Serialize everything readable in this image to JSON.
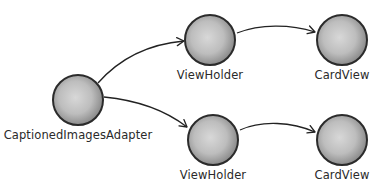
{
  "diagram": {
    "type": "object-relationship",
    "nodes": [
      {
        "id": "adapter",
        "label": "CaptionedImagesAdapter",
        "cx": 78,
        "cy": 100
      },
      {
        "id": "viewholder_top",
        "label": "ViewHolder",
        "cx": 210,
        "cy": 40
      },
      {
        "id": "cardview_top",
        "label": "CardView",
        "cx": 342,
        "cy": 40
      },
      {
        "id": "viewholder_bottom",
        "label": "ViewHolder",
        "cx": 213,
        "cy": 140
      },
      {
        "id": "cardview_bottom",
        "label": "CardView",
        "cx": 342,
        "cy": 140
      }
    ],
    "edges": [
      {
        "from": "adapter",
        "to": "viewholder_top"
      },
      {
        "from": "adapter",
        "to": "viewholder_bottom"
      },
      {
        "from": "viewholder_top",
        "to": "cardview_top"
      },
      {
        "from": "viewholder_bottom",
        "to": "cardview_bottom"
      }
    ],
    "colors": {
      "node_fill_center": "#d4d4d4",
      "node_fill_edge": "#9a9a9a",
      "node_stroke": "#2b2b2b",
      "arrow": "#222222",
      "label": "#2a2a2a"
    }
  }
}
